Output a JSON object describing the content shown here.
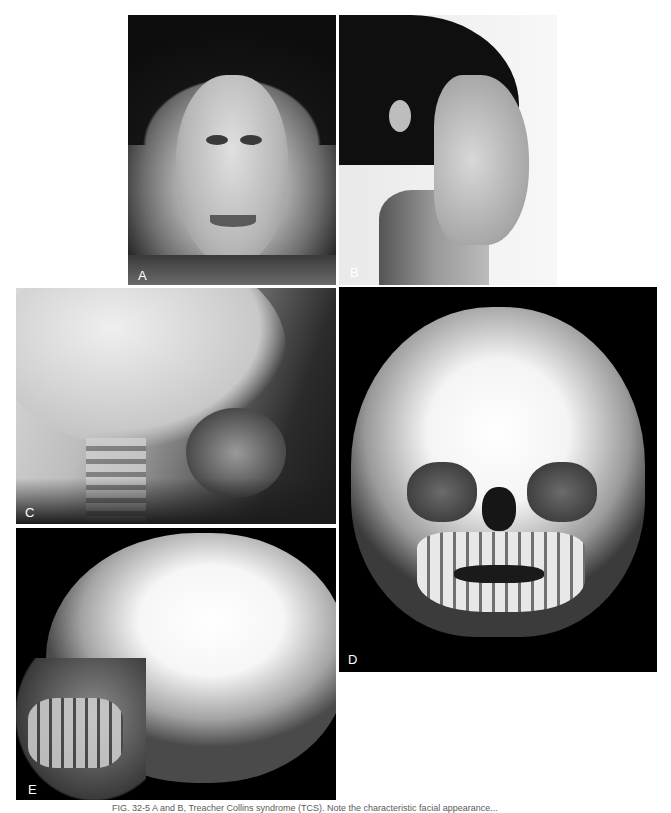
{
  "figure": {
    "panels": [
      {
        "id": "A",
        "label": "A",
        "description": "Frontal photograph of patient"
      },
      {
        "id": "B",
        "label": "B",
        "description": "Lateral profile photograph of patient"
      },
      {
        "id": "C",
        "label": "C",
        "description": "Lateral cephalometric radiograph"
      },
      {
        "id": "D",
        "label": "D",
        "description": "3D CT reconstruction, frontal view"
      },
      {
        "id": "E",
        "label": "E",
        "description": "3D CT reconstruction, lateral oblique view"
      }
    ],
    "caption": "FIG. 32-5 A and B, Treacher Collins syndrome (TCS). Note the characteristic facial appearance..."
  },
  "colors": {
    "background": "#ffffff",
    "panel_dark": "#000000",
    "label_text": "#ffffff",
    "caption_text": "#5a5a5a"
  }
}
